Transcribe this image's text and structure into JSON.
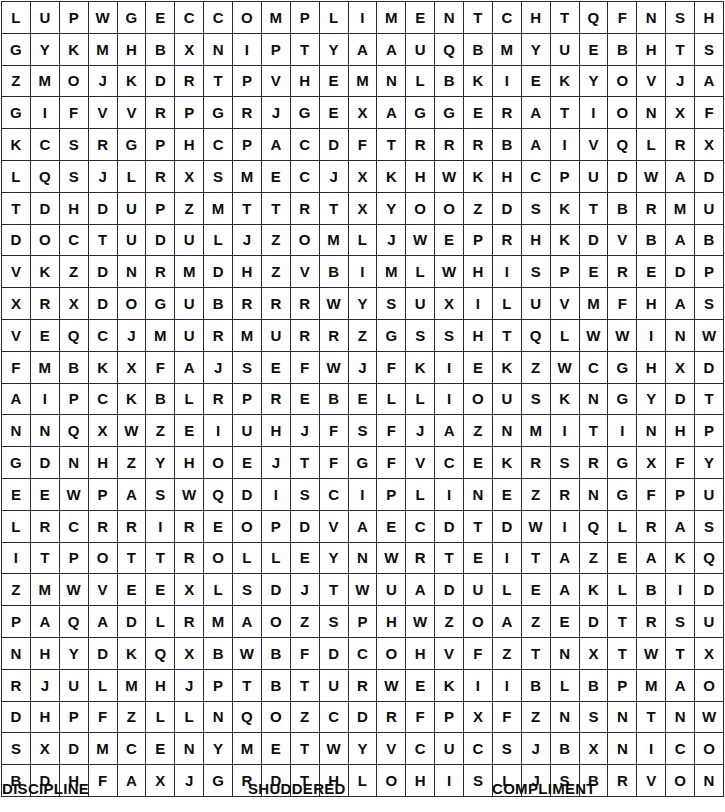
{
  "puzzle": {
    "type": "word-search",
    "rows": 25,
    "cols": 25,
    "grid": [
      "LUPWGECCOMPLIMENTCHTQFNSH",
      "GYKMHBXNIPTYAAUQBMYUEBHTS",
      "ZMOJKDRTPVHEMNLBKIEKYOVJA",
      "GIFVVRPGRJGEXAGGERATIONXF",
      "KCSRGPHCPACDFTRRRBAIVQLRX",
      "LQSJLRXSMECJXKHWKHCPUDWAD",
      "TDHDUPZMTTRTXYOOZDSKTBRMU",
      "DOCTUDULJZOMLJWEPRHKDVBAB",
      "VKZDNRMDHZVBIMLWHISPEREDP",
      "XRXDOGUBRRRWYSUXILUVMFHAS",
      "VEQCJMURMURRZGSSHTQLWWINW",
      "FMBKXFAJSEFWJFKIEKZWCGHXD",
      "AIPCKBLRPREBELLIOUSKNGYDT",
      "NNQXWZEIUHJFSFJAZNMITINHP",
      "GDNHZYHOEJTFGFVCEKRSRGXFY",
      "EEWPASWQDISCIPLINEZRNGFPU",
      "LRCRRIREOPDVAECDTDWIQLRAS",
      "ITPOTTROLLEYNWRTEITAZEAKQ",
      "ZMWVEEXLSDJTWUADULEAKLBID",
      "PAQADLRMAOZSPHWZOAZEDTRSU",
      "NHYDKQXBWBFDCOHVFZTNXTWTX",
      "RJULMHJPTBTURWEKIIBLBPMAO",
      "DHPFZLLNQOZCDRFPXFZNSNTNW",
      "SXDMCENYMETWYVCUCSJBXNICO",
      "BDHFAXJGRDTHLOHISLJSBRVON"
    ]
  },
  "word_list": {
    "words": [
      "DISCIPLINE",
      "SHUDDERED",
      "COMPLIMENT"
    ]
  }
}
